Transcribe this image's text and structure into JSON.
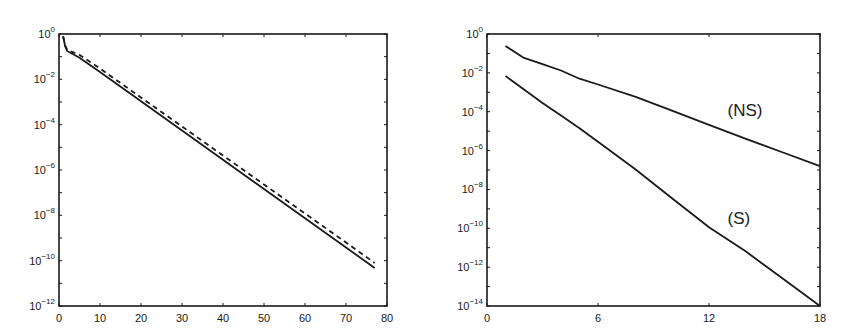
{
  "chart_data": [
    {
      "id": "left",
      "type": "line",
      "title": "",
      "xlabel": "",
      "ylabel": "",
      "yscale": "log",
      "xlim": [
        0,
        80
      ],
      "ylim_exp": [
        -12,
        0
      ],
      "xticks": [
        0,
        10,
        20,
        30,
        40,
        50,
        60,
        70,
        80
      ],
      "xtick_labels": [
        "0",
        "10",
        "20",
        "30",
        "40",
        "50",
        "60",
        "70",
        "80"
      ],
      "yticks_exp": [
        0,
        -2,
        -4,
        -6,
        -8,
        -10,
        -12
      ],
      "ytick_labels": [
        "10^0",
        "10^-2",
        "10^-4",
        "10^-6",
        "10^-8",
        "10^-10",
        "10^-12"
      ],
      "grid": false,
      "legend": null,
      "series": [
        {
          "name": "solid",
          "style": "solid",
          "x": [
            1,
            1.5,
            2,
            5,
            10,
            20,
            30,
            40,
            50,
            60,
            70,
            77
          ],
          "log10_y": [
            -0.1,
            -0.55,
            -0.75,
            -1.05,
            -1.68,
            -2.97,
            -4.26,
            -5.55,
            -6.84,
            -8.13,
            -9.42,
            -10.32
          ]
        },
        {
          "name": "dashed",
          "style": "dashed",
          "x": [
            1,
            1.5,
            2,
            5,
            10,
            20,
            30,
            40,
            50,
            60,
            70,
            77
          ],
          "log10_y": [
            -0.1,
            -0.5,
            -0.7,
            -0.92,
            -1.52,
            -2.8,
            -4.08,
            -5.36,
            -6.64,
            -7.92,
            -9.2,
            -10.1
          ]
        }
      ]
    },
    {
      "id": "right",
      "type": "line",
      "title": "",
      "xlabel": "",
      "ylabel": "",
      "yscale": "log",
      "xlim": [
        0,
        18
      ],
      "ylim_exp": [
        -14,
        0
      ],
      "xticks": [
        0,
        6,
        12,
        18
      ],
      "xtick_labels": [
        "0",
        "6",
        "12",
        "18"
      ],
      "yticks_exp": [
        0,
        -2,
        -4,
        -6,
        -8,
        -10,
        -12,
        -14
      ],
      "ytick_labels": [
        "10^0",
        "10^-2",
        "10^-4",
        "10^-6",
        "10^-8",
        "10^-10",
        "10^-12",
        "10^-14"
      ],
      "grid": false,
      "legend": null,
      "annotations": [
        {
          "text": "(NS)",
          "x": 13.0,
          "log10_y": -4.2
        },
        {
          "text": "(S)",
          "x": 13.0,
          "log10_y": -9.8
        }
      ],
      "series": [
        {
          "name": "(NS)",
          "style": "solid",
          "x": [
            1,
            2,
            3,
            4,
            5,
            6,
            8,
            10,
            12,
            14,
            16,
            18
          ],
          "log10_y": [
            -0.62,
            -1.23,
            -1.55,
            -1.88,
            -2.3,
            -2.6,
            -3.22,
            -3.95,
            -4.68,
            -5.4,
            -6.1,
            -6.8
          ]
        },
        {
          "name": "(S)",
          "style": "solid",
          "x": [
            1,
            2,
            3,
            4,
            5,
            6,
            8,
            10,
            12,
            14,
            16,
            18
          ],
          "log10_y": [
            -2.16,
            -2.85,
            -3.55,
            -4.2,
            -4.85,
            -5.55,
            -6.95,
            -8.45,
            -9.95,
            -11.2,
            -12.6,
            -14.0
          ]
        }
      ]
    }
  ],
  "layout": {
    "panels": [
      {
        "left": 59,
        "top": 34,
        "right": 387,
        "bottom": 306
      },
      {
        "left": 487,
        "top": 34,
        "right": 820,
        "bottom": 306
      }
    ]
  }
}
